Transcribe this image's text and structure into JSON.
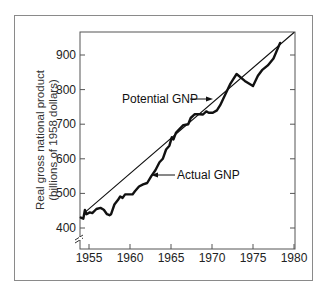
{
  "chart_data": {
    "type": "line",
    "title": "",
    "xlabel": "",
    "ylabel": "Real gross national product (billions of 1958 dollars)",
    "ylabel_lines": [
      "Real gross national product",
      "(billions of 1958 dollars)"
    ],
    "xlim": [
      1953.9,
      1980
    ],
    "ylim": [
      350,
      965
    ],
    "x_ticks": [
      1955,
      1960,
      1965,
      1970,
      1975,
      1980
    ],
    "y_ticks": [
      400,
      500,
      600,
      700,
      800,
      900
    ],
    "y_axis_break": true,
    "grid": false,
    "legend": "none (inline annotations with arrows)",
    "series": [
      {
        "name": "Potential GNP",
        "style": "thin line",
        "x": [
          1954.5,
          1980
        ],
        "values": [
          445,
          965
        ]
      },
      {
        "name": "Actual GNP",
        "style": "thick line",
        "x": [
          1954.0,
          1954.3,
          1954.5,
          1954.7,
          1955.1,
          1955.4,
          1955.9,
          1956.4,
          1956.8,
          1957.2,
          1957.5,
          1957.7,
          1958.1,
          1958.5,
          1958.8,
          1959.1,
          1959.4,
          1959.9,
          1960.3,
          1960.6,
          1961.1,
          1961.6,
          1962.1,
          1962.6,
          1963.1,
          1963.6,
          1964.0,
          1964.4,
          1964.8,
          1965.1,
          1965.3,
          1965.6,
          1966.0,
          1966.5,
          1967.1,
          1967.4,
          1967.9,
          1968.5,
          1968.9,
          1969.3,
          1969.6,
          1970.1,
          1970.6,
          1971.0,
          1971.4,
          1971.8,
          1972.2,
          1972.6,
          1973.0,
          1974.0,
          1975.0,
          1975.6,
          1976.1,
          1976.8,
          1977.5,
          1978.3
        ],
        "values": [
          430,
          427,
          452,
          440,
          445,
          443,
          455,
          458,
          453,
          440,
          437,
          440,
          468,
          480,
          491,
          487,
          497,
          497,
          497,
          506,
          520,
          526,
          530,
          550,
          567,
          590,
          600,
          627,
          638,
          662,
          656,
          675,
          685,
          697,
          700,
          718,
          729,
          729,
          728,
          737,
          733,
          733,
          740,
          755,
          775,
          795,
          815,
          830,
          845,
          825,
          810,
          840,
          856,
          870,
          890,
          935
        ]
      }
    ],
    "annotations": [
      {
        "text": "Potential GNP",
        "points_to": "Potential GNP line near 1971"
      },
      {
        "text": "Actual GNP",
        "points_to": "Actual GNP line near 1963"
      }
    ]
  },
  "labels": {
    "ylabel_line1": "Real gross national product",
    "ylabel_line2": "(billions of 1958 dollars)",
    "potential": "Potential GNP",
    "actual": "Actual GNP"
  },
  "colors": {
    "line": "#111111",
    "axis": "#555555",
    "frame": "#8a8a8a"
  }
}
